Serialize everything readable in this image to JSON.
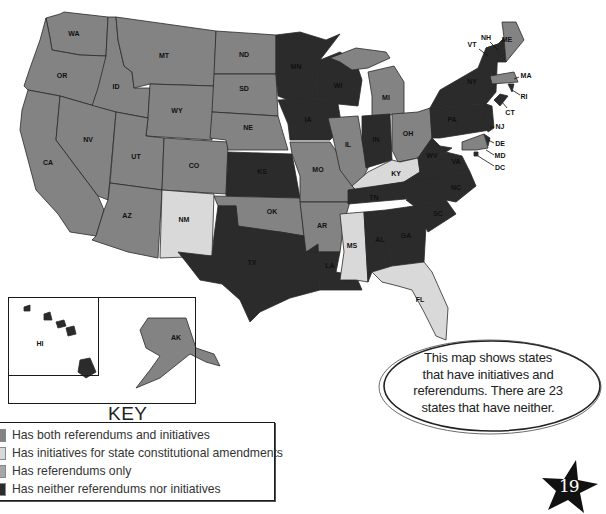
{
  "colors": {
    "both": "#838383",
    "initiatives_constitutional": "#d9d9d9",
    "referendums_only": "#a6a6a6",
    "neither": "#2b2b2b",
    "outline": "#2a2a2a"
  },
  "map": {
    "states": [
      {
        "abbr": "WA",
        "category": "both"
      },
      {
        "abbr": "OR",
        "category": "both"
      },
      {
        "abbr": "CA",
        "category": "both"
      },
      {
        "abbr": "ID",
        "category": "both"
      },
      {
        "abbr": "NV",
        "category": "both"
      },
      {
        "abbr": "MT",
        "category": "both"
      },
      {
        "abbr": "WY",
        "category": "both"
      },
      {
        "abbr": "UT",
        "category": "both"
      },
      {
        "abbr": "AZ",
        "category": "both"
      },
      {
        "abbr": "CO",
        "category": "both"
      },
      {
        "abbr": "NM",
        "category": "initiatives_constitutional"
      },
      {
        "abbr": "ND",
        "category": "both"
      },
      {
        "abbr": "SD",
        "category": "both"
      },
      {
        "abbr": "NE",
        "category": "both"
      },
      {
        "abbr": "KS",
        "category": "neither"
      },
      {
        "abbr": "OK",
        "category": "both"
      },
      {
        "abbr": "TX",
        "category": "neither"
      },
      {
        "abbr": "MN",
        "category": "neither"
      },
      {
        "abbr": "IA",
        "category": "neither"
      },
      {
        "abbr": "MO",
        "category": "both"
      },
      {
        "abbr": "AR",
        "category": "both"
      },
      {
        "abbr": "LA",
        "category": "neither"
      },
      {
        "abbr": "WI",
        "category": "neither"
      },
      {
        "abbr": "IL",
        "category": "both"
      },
      {
        "abbr": "MS",
        "category": "initiatives_constitutional"
      },
      {
        "abbr": "MI",
        "category": "both"
      },
      {
        "abbr": "IN",
        "category": "neither"
      },
      {
        "abbr": "OH",
        "category": "both"
      },
      {
        "abbr": "KY",
        "category": "initiatives_constitutional"
      },
      {
        "abbr": "TN",
        "category": "neither"
      },
      {
        "abbr": "AL",
        "category": "neither"
      },
      {
        "abbr": "GA",
        "category": "neither"
      },
      {
        "abbr": "FL",
        "category": "initiatives_constitutional"
      },
      {
        "abbr": "SC",
        "category": "neither"
      },
      {
        "abbr": "NC",
        "category": "neither"
      },
      {
        "abbr": "VA",
        "category": "neither"
      },
      {
        "abbr": "WV",
        "category": "neither"
      },
      {
        "abbr": "PA",
        "category": "neither"
      },
      {
        "abbr": "NY",
        "category": "neither"
      },
      {
        "abbr": "VT",
        "category": "neither"
      },
      {
        "abbr": "NH",
        "category": "neither"
      },
      {
        "abbr": "ME",
        "category": "both"
      },
      {
        "abbr": "MA",
        "category": "both"
      },
      {
        "abbr": "RI",
        "category": "neither"
      },
      {
        "abbr": "CT",
        "category": "neither"
      },
      {
        "abbr": "NJ",
        "category": "neither"
      },
      {
        "abbr": "DE",
        "category": "neither"
      },
      {
        "abbr": "MD",
        "category": "both"
      },
      {
        "abbr": "DC",
        "category": "neither"
      },
      {
        "abbr": "AK",
        "category": "both"
      },
      {
        "abbr": "HI",
        "category": "neither"
      }
    ]
  },
  "key": {
    "title": "KEY",
    "items": [
      {
        "category": "both",
        "label": "Has both referendums and initiatives"
      },
      {
        "category": "initiatives_constitutional",
        "label": "Has initiatives for state constitutional amendments"
      },
      {
        "category": "referendums_only",
        "label": "Has referendums only"
      },
      {
        "category": "neither",
        "label": "Has neither referendums nor initiatives"
      }
    ]
  },
  "callout": {
    "lines": [
      "This map shows states",
      "that have initiatives and",
      "referendums. There are 23",
      "states that have neither."
    ]
  },
  "page": {
    "number": "19"
  }
}
